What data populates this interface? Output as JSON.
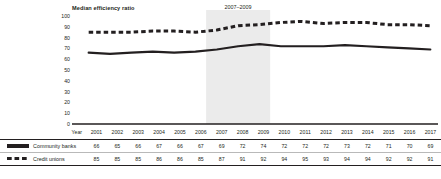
{
  "chart_data": {
    "type": "line",
    "title": "Median efficiency ratio",
    "xlabel": "Year",
    "ylabel": "",
    "ylim": [
      0,
      100
    ],
    "yticks": [
      100,
      90,
      80,
      70,
      60,
      50,
      40,
      30,
      20,
      10,
      0
    ],
    "grid": false,
    "legend_position": "bottom-table",
    "categories": [
      "2001",
      "2002",
      "2003",
      "2004",
      "2005",
      "2006",
      "2007",
      "2008",
      "2009",
      "2010",
      "2011",
      "2012",
      "2013",
      "2014",
      "2015",
      "2016",
      "2017"
    ],
    "series": [
      {
        "name": "Community banks",
        "style": "solid",
        "values": [
          66,
          65,
          66,
          67,
          66,
          67,
          69,
          72,
          74,
          72,
          72,
          72,
          73,
          72,
          71,
          70,
          69
        ]
      },
      {
        "name": "Credit unions",
        "style": "dashed",
        "values": [
          85,
          85,
          85,
          86,
          86,
          85,
          87,
          91,
          92,
          94,
          95,
          93,
          94,
          94,
          92,
          92,
          91
        ]
      }
    ],
    "annotations": [
      {
        "name": "financial-crisis-band",
        "line1": "2007–2009",
        "line2": "financial crisis",
        "start": "2007",
        "end": "2009",
        "shade_color": "#ebebeb"
      }
    ],
    "colors": {
      "line": "#231f20",
      "axis": "#231f20",
      "shade": "#ebebeb",
      "rule": "#231f20"
    }
  },
  "table": {
    "year_header_label": "Year",
    "row_labels": [
      "Community banks",
      "Credit unions"
    ]
  }
}
